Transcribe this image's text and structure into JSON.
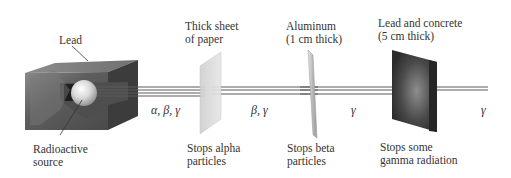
{
  "diagram": {
    "source": {
      "shield_label": "Lead",
      "source_label_line1": "Radioactive",
      "source_label_line2": "source"
    },
    "beams": [
      {
        "segment": "source-to-paper",
        "label": "α, β, γ"
      },
      {
        "segment": "paper-to-aluminum",
        "label": "β, γ"
      },
      {
        "segment": "aluminum-to-lead",
        "label": "γ"
      },
      {
        "segment": "after-lead",
        "label": "γ"
      }
    ],
    "barriers": [
      {
        "name": "paper",
        "label_line1": "Thick sheet",
        "label_line2": "of paper",
        "effect_line1": "Stops alpha",
        "effect_line2": "particles"
      },
      {
        "name": "aluminum",
        "label_line1": "Aluminum",
        "label_line2": "(1 cm thick)",
        "effect_line1": "Stops beta",
        "effect_line2": "particles"
      },
      {
        "name": "lead-concrete",
        "label_line1": "Lead and concrete",
        "label_line2": "(5 cm thick)",
        "effect_line1": "Stops some",
        "effect_line2": "gamma radiation"
      }
    ],
    "colors": {
      "lead_dark": "#3a3a3a",
      "lead_mid": "#6b6b6b",
      "paper": "#dcdcdc",
      "aluminum": "#c4c4c4",
      "beam": "#5a5a5a"
    }
  }
}
